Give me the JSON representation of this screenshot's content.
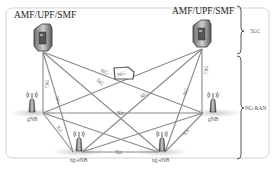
{
  "diagram": {
    "core_nodes": [
      {
        "id": "amf-left",
        "label": "AMF/UPF/SMF",
        "icon": "server-icon"
      },
      {
        "id": "amf-right",
        "label": "AMF/UPF/SMF",
        "icon": "server-icon"
      }
    ],
    "ran_nodes": [
      {
        "id": "gnb-left",
        "label": "gNB",
        "icon": "antenna-tower-icon"
      },
      {
        "id": "gnb-right",
        "label": "gNB",
        "icon": "antenna-tower-icon"
      },
      {
        "id": "ngenb-left",
        "label": "ng-eNB",
        "icon": "antenna-tower-icon"
      },
      {
        "id": "ngenb-right",
        "label": "ng-eNB",
        "icon": "antenna-tower-icon"
      }
    ],
    "interfaces": {
      "ng": "NG",
      "xn": "Xn"
    },
    "cloud_label": "NG",
    "groups": [
      {
        "id": "5gc",
        "label": "5GC"
      },
      {
        "id": "ng-ran",
        "label": "NG-RAN"
      }
    ],
    "links": [
      {
        "from": "amf-left",
        "to": "gnb-left",
        "label": "NG"
      },
      {
        "from": "amf-left",
        "to": "ngenb-left",
        "label": "NG"
      },
      {
        "from": "amf-left",
        "to": "ngenb-right",
        "label": "NG"
      },
      {
        "from": "amf-left",
        "to": "gnb-right",
        "label": "NG"
      },
      {
        "from": "amf-right",
        "to": "gnb-right",
        "label": "NG"
      },
      {
        "from": "amf-right",
        "to": "ngenb-right",
        "label": "NG"
      },
      {
        "from": "amf-right",
        "to": "ngenb-left",
        "label": "NG"
      },
      {
        "from": "amf-right",
        "to": "gnb-left",
        "label": "NG"
      },
      {
        "from": "gnb-left",
        "to": "gnb-right",
        "label": "Xn"
      },
      {
        "from": "gnb-left",
        "to": "ngenb-left",
        "label": "Xn"
      },
      {
        "from": "gnb-right",
        "to": "ngenb-right",
        "label": "Xn"
      },
      {
        "from": "ngenb-left",
        "to": "ngenb-right",
        "label": "Xn"
      },
      {
        "from": "gnb-left",
        "to": "ngenb-right",
        "label": ""
      },
      {
        "from": "gnb-right",
        "to": "ngenb-left",
        "label": ""
      }
    ]
  }
}
